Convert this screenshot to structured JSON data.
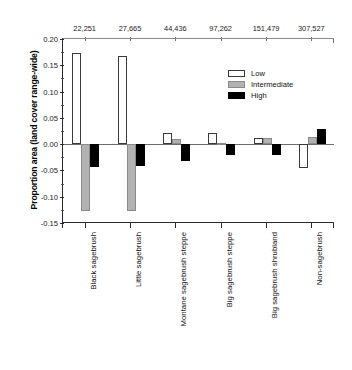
{
  "chart_data": {
    "type": "bar",
    "title": "",
    "xlabel": "",
    "ylabel": "Proportion area (land cover range-wide)",
    "ylim": [
      -0.15,
      0.2
    ],
    "yticks": [
      0.2,
      0.15,
      0.1,
      0.05,
      0.0,
      -0.05,
      -0.1,
      -0.15
    ],
    "ytick_labels": [
      "0.20",
      "0.15",
      "0.10",
      "0.05",
      "0.00",
      "-0.05",
      "-0.10",
      "-0.15"
    ],
    "grid": false,
    "legend_position": "upper right",
    "categories": [
      "Black sagebrush",
      "Little sagebrush",
      "Montane sagebrush steppe",
      "Big sagebrush steppe",
      "Big sagebrush shrubland",
      "Non-sagebrush"
    ],
    "top_axis_label": "",
    "top_axis_values": [
      "22,251",
      "27,665",
      "44,436",
      "97,262",
      "151,479",
      "307,527"
    ],
    "series": [
      {
        "name": "Low",
        "color": "#ffffff",
        "values": [
          0.173,
          0.168,
          0.022,
          0.021,
          0.011,
          -0.045
        ]
      },
      {
        "name": "Intermediate",
        "color": "#b2b2b2",
        "values": [
          -0.128,
          -0.127,
          0.01,
          0.002,
          0.012,
          0.013
        ]
      },
      {
        "name": "High",
        "color": "#000000",
        "values": [
          -0.043,
          -0.041,
          -0.032,
          -0.021,
          -0.02,
          0.029
        ]
      }
    ]
  },
  "legend": {
    "items": [
      {
        "label": "Low",
        "swatch": "sw-low"
      },
      {
        "label": "Intermediate",
        "swatch": "sw-intermediate"
      },
      {
        "label": "High",
        "swatch": "sw-high"
      }
    ]
  }
}
